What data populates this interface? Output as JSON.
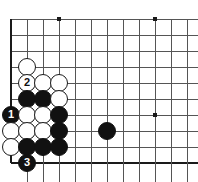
{
  "diagram": {
    "type": "go-board-diagram",
    "board_size": 19,
    "view": {
      "columns_x": [
        11,
        27,
        43,
        59,
        75,
        91,
        107,
        123,
        139,
        155,
        171,
        187
      ],
      "rows_y": [
        19,
        35,
        51,
        67,
        83,
        99,
        115,
        131,
        147,
        163
      ],
      "cell_px": 16,
      "edges": {
        "left": true,
        "bottom": true,
        "top": false,
        "right": false
      }
    },
    "colors": {
      "background": "#ffffff",
      "grid_line": "#555555",
      "edge_line": "#1a1a1a",
      "black_stone": "#111111",
      "white_stone": "#ffffff",
      "white_stone_border": "#1a1a1a"
    },
    "star_points": [
      {
        "x": 59,
        "y": 19
      },
      {
        "x": 155,
        "y": 19
      },
      {
        "x": 155,
        "y": 115
      }
    ],
    "stones": [
      {
        "color": "white",
        "x": 27,
        "y": 67,
        "label": ""
      },
      {
        "color": "white",
        "x": 27,
        "y": 83,
        "label": "2"
      },
      {
        "color": "white",
        "x": 43,
        "y": 83,
        "label": ""
      },
      {
        "color": "white",
        "x": 59,
        "y": 83,
        "label": ""
      },
      {
        "color": "black",
        "x": 27,
        "y": 99,
        "label": ""
      },
      {
        "color": "black",
        "x": 43,
        "y": 99,
        "label": ""
      },
      {
        "color": "white",
        "x": 59,
        "y": 99,
        "label": ""
      },
      {
        "color": "black",
        "x": 11,
        "y": 115,
        "label": "1"
      },
      {
        "color": "white",
        "x": 27,
        "y": 115,
        "label": ""
      },
      {
        "color": "white",
        "x": 43,
        "y": 115,
        "label": ""
      },
      {
        "color": "black",
        "x": 59,
        "y": 115,
        "label": ""
      },
      {
        "color": "white",
        "x": 11,
        "y": 131,
        "label": ""
      },
      {
        "color": "white",
        "x": 27,
        "y": 131,
        "label": ""
      },
      {
        "color": "white",
        "x": 43,
        "y": 131,
        "label": ""
      },
      {
        "color": "black",
        "x": 59,
        "y": 131,
        "label": ""
      },
      {
        "color": "black",
        "x": 107,
        "y": 131,
        "label": ""
      },
      {
        "color": "white",
        "x": 11,
        "y": 147,
        "label": ""
      },
      {
        "color": "black",
        "x": 27,
        "y": 147,
        "label": ""
      },
      {
        "color": "black",
        "x": 43,
        "y": 147,
        "label": ""
      },
      {
        "color": "black",
        "x": 59,
        "y": 147,
        "label": ""
      },
      {
        "color": "black",
        "x": 27,
        "y": 163,
        "label": "3"
      }
    ],
    "move_labels": [
      "1",
      "2",
      "3"
    ]
  }
}
